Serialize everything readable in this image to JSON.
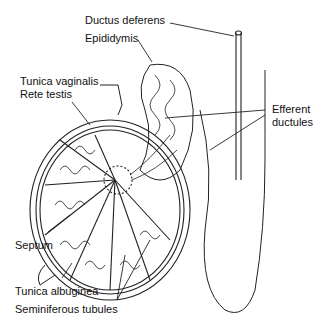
{
  "diagram": {
    "labels": {
      "ductus_deferens": "Ductus deferens",
      "epididymis": "Epididymis",
      "tunica_vaginalis": "Tunica vaginalis",
      "rete_testis": "Rete testis",
      "efferent_ductules_1": "Efferent",
      "efferent_ductules_2": "ductules",
      "septum": "Septum",
      "tunica_albuginea": "Tunica albuginea",
      "seminiferous_tubules": "Seminiferous tubules"
    }
  }
}
